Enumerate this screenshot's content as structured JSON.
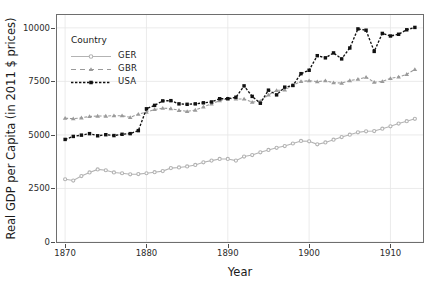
{
  "chart_data": {
    "type": "line",
    "title": "",
    "xlabel": "Year",
    "ylabel": "Real GDP per Capita (in 2011 $ prices)",
    "xlim": [
      1869,
      1914
    ],
    "ylim": [
      0,
      10600
    ],
    "xticks": [
      1870,
      1880,
      1890,
      1900,
      1910
    ],
    "yticks": [
      0,
      2500,
      5000,
      7500,
      10000
    ],
    "xtick_labels": [
      "1870",
      "1880",
      "1890",
      "1900",
      "1910"
    ],
    "ytick_labels": [
      "0",
      "2500",
      "5000",
      "7500",
      "10000"
    ],
    "grid": true,
    "legend_position": "top-left",
    "legend_title": "Country",
    "x": [
      1870,
      1871,
      1872,
      1873,
      1874,
      1875,
      1876,
      1877,
      1878,
      1879,
      1880,
      1881,
      1882,
      1883,
      1884,
      1885,
      1886,
      1887,
      1888,
      1889,
      1890,
      1891,
      1892,
      1893,
      1894,
      1895,
      1896,
      1897,
      1898,
      1899,
      1900,
      1901,
      1902,
      1903,
      1904,
      1905,
      1906,
      1907,
      1908,
      1909,
      1910,
      1911,
      1912,
      1913
    ],
    "series": [
      {
        "name": "GER",
        "color": "#b3b3b3",
        "marker": "circle",
        "dash": "solid",
        "values": [
          2930,
          2870,
          3080,
          3250,
          3390,
          3350,
          3250,
          3210,
          3160,
          3170,
          3210,
          3260,
          3310,
          3450,
          3480,
          3530,
          3600,
          3720,
          3800,
          3880,
          3880,
          3800,
          3990,
          4060,
          4190,
          4300,
          4400,
          4480,
          4600,
          4720,
          4700,
          4560,
          4650,
          4780,
          4900,
          5010,
          5120,
          5170,
          5180,
          5290,
          5400,
          5530,
          5640,
          5750
        ]
      },
      {
        "name": "GBR",
        "color": "#9a9a9a",
        "marker": "triangle",
        "dash": "dashed",
        "values": [
          5780,
          5760,
          5800,
          5860,
          5880,
          5880,
          5900,
          5900,
          5820,
          5970,
          6060,
          6190,
          6250,
          6230,
          6150,
          6100,
          6160,
          6310,
          6450,
          6600,
          6700,
          6680,
          6680,
          6530,
          6580,
          6870,
          7080,
          7100,
          7320,
          7500,
          7530,
          7490,
          7530,
          7440,
          7420,
          7540,
          7600,
          7700,
          7460,
          7500,
          7640,
          7710,
          7830,
          8060
        ]
      },
      {
        "name": "USA",
        "color": "#111111",
        "marker": "square",
        "dash": "dashed",
        "values": [
          4790,
          4930,
          4990,
          5060,
          4960,
          5010,
          4970,
          5030,
          5060,
          5200,
          6220,
          6380,
          6590,
          6600,
          6450,
          6430,
          6450,
          6500,
          6540,
          6690,
          6690,
          6760,
          7290,
          6800,
          6480,
          7090,
          6870,
          7230,
          7310,
          7860,
          8020,
          8700,
          8600,
          8830,
          8550,
          9060,
          9950,
          9890,
          8900,
          9740,
          9620,
          9700,
          9910,
          10020
        ]
      }
    ]
  },
  "legend": {
    "title": "Country",
    "entries": [
      {
        "label": "GER"
      },
      {
        "label": "GBR"
      },
      {
        "label": "USA"
      }
    ]
  },
  "axes": {
    "x_title": "Year",
    "y_title": "Real GDP per Capita (in 2011 $ prices)"
  }
}
